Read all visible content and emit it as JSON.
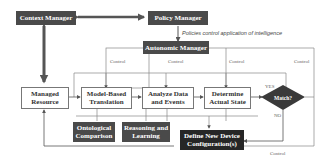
{
  "diagram": {
    "nodes": {
      "context_manager": "Context Manager",
      "policy_manager": "Policy Manager",
      "autonomic_manager": "Autonomic Manager",
      "managed_resource": "Managed Resource",
      "model_based_translation": "Model-Based Translation",
      "analyze_data_events": "Analyze Data and Events",
      "determine_actual_state": "Determine Actual State",
      "match": "Match?",
      "ontological_comparison": "Ontological Comparison",
      "reasoning_learning": "Reasoning and Learning",
      "define_new_config": "Define New Device Configuration(s)"
    },
    "labels": {
      "policy_note": "Policies control application of intelligence",
      "control_1": "Control",
      "control_2": "Control",
      "control_3": "Control",
      "control_4": "Control",
      "control_bottom": "Control",
      "yes": "YES",
      "no": "NO"
    },
    "colors": {
      "dark_box": "#4a4a4a",
      "darker_box": "#262626",
      "line": "#777777",
      "thick_arrow": "#555555"
    }
  }
}
